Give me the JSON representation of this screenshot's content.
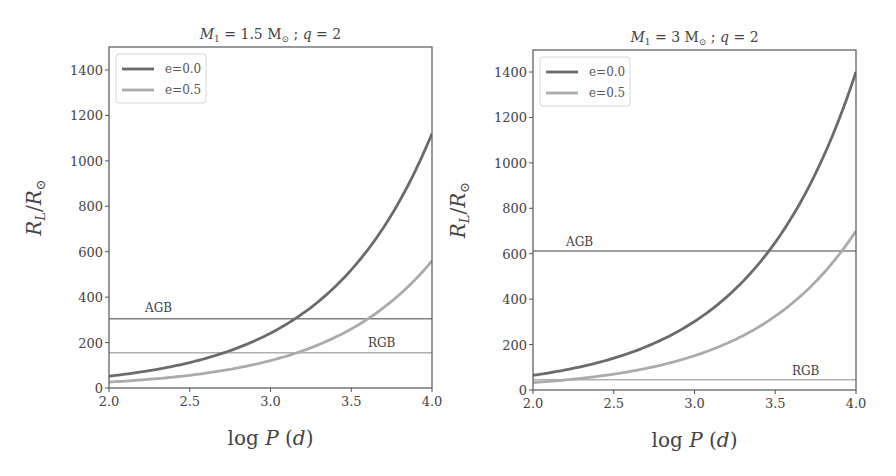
{
  "chart_data": [
    {
      "type": "line",
      "title": "M_1 = 1.5 M_⊙ ; q = 2",
      "title_parts": {
        "m": "M",
        "sub": "1",
        "rest": " = 1.5 M",
        "sun": "⊙",
        "tail": " ; q = 2"
      },
      "xlabel": "log P (d)",
      "ylabel": "R_L/R_⊙",
      "xlim": [
        2.0,
        4.0
      ],
      "ylim": [
        0,
        1500
      ],
      "xticks": [
        "2.0",
        "2.5",
        "3.0",
        "3.5",
        "4.0"
      ],
      "yticks": [
        "0",
        "200",
        "400",
        "600",
        "800",
        "1000",
        "1200",
        "1400"
      ],
      "grid": false,
      "legend_position": "upper left",
      "x": [
        2.0,
        2.25,
        2.5,
        2.75,
        3.0,
        3.25,
        3.5,
        3.75,
        4.0
      ],
      "series": [
        {
          "name": "e=0.0",
          "color": "#6b6b6b",
          "values": [
            52,
            76,
            112,
            165,
            242,
            355,
            521,
            764,
            1120
          ]
        },
        {
          "name": "e=0.5",
          "color": "#ababab",
          "values": [
            26,
            38,
            56,
            82,
            121,
            177,
            260,
            382,
            560
          ]
        }
      ],
      "hlines": [
        {
          "label": "AGB",
          "value": 305,
          "color": "#808080"
        },
        {
          "label": "RGB",
          "value": 155,
          "color": "#b0b0b0"
        }
      ]
    },
    {
      "type": "line",
      "title": "M_1 = 3 M_⊙ ; q = 2",
      "title_parts": {
        "m": "M",
        "sub": "1",
        "rest": " = 3 M",
        "sun": "⊙",
        "tail": " ; q = 2"
      },
      "xlabel": "log P (d)",
      "ylabel": "R_L/R_⊙",
      "xlim": [
        2.0,
        4.0
      ],
      "ylim": [
        0,
        1500
      ],
      "xticks": [
        "2.0",
        "2.5",
        "3.0",
        "3.5",
        "4.0"
      ],
      "yticks": [
        "0",
        "200",
        "400",
        "600",
        "800",
        "1000",
        "1200",
        "1400"
      ],
      "grid": false,
      "legend_position": "upper left",
      "x": [
        2.0,
        2.25,
        2.5,
        2.75,
        3.0,
        3.25,
        3.5,
        3.75,
        4.0
      ],
      "series": [
        {
          "name": "e=0.0",
          "color": "#6b6b6b",
          "values": [
            65,
            95,
            140,
            206,
            302,
            443,
            650,
            954,
            1410
          ]
        },
        {
          "name": "e=0.5",
          "color": "#ababab",
          "values": [
            32,
            48,
            70,
            103,
            151,
            221,
            325,
            477,
            700
          ]
        }
      ],
      "hlines": [
        {
          "label": "AGB",
          "value": 612,
          "color": "#808080"
        },
        {
          "label": "RGB",
          "value": 45,
          "color": "#b0b0b0"
        }
      ]
    }
  ],
  "panels": [
    {
      "box": {
        "left": 109,
        "top": 47,
        "right": 432,
        "bottom": 388
      },
      "y0_px": 388,
      "y1400_px": 70,
      "r0": [
        52,
        26
      ],
      "ann_pos": [
        {
          "x": 145,
          "y": 312
        },
        {
          "x": 368,
          "y": 347
        }
      ]
    },
    {
      "box": {
        "left": 533,
        "top": 50,
        "right": 856,
        "bottom": 390
      },
      "y0_px": 390,
      "y1400_px": 72,
      "r0": [
        65,
        32.5
      ],
      "ann_pos": [
        {
          "x": 566,
          "y": 246
        },
        {
          "x": 792,
          "y": 375
        }
      ]
    }
  ]
}
